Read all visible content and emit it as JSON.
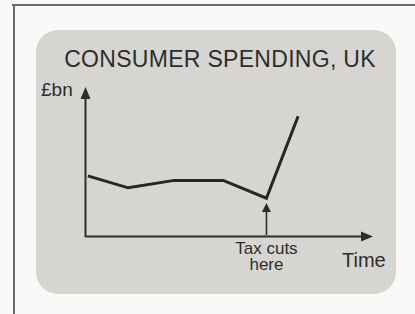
{
  "figure": {
    "title": "CONSUMER SPENDING, UK",
    "ylabel": "£bn",
    "xlabel": "Time",
    "annotation_line1": "Tax cuts",
    "annotation_line2": "here"
  },
  "chart_data": {
    "type": "line",
    "title": "CONSUMER SPENDING, UK",
    "xlabel": "Time",
    "ylabel": "£bn",
    "x_ticks": [],
    "y_ticks": [],
    "grid": false,
    "legend": false,
    "axes_note": "sketch diagram with unscaled arrow axes; coordinates normalized 0-1 along each axis",
    "xlim": [
      0,
      1
    ],
    "ylim": [
      0,
      1
    ],
    "series": [
      {
        "name": "consumer-spending",
        "points": [
          [
            0.01,
            0.41
          ],
          [
            0.15,
            0.33
          ],
          [
            0.31,
            0.38
          ],
          [
            0.48,
            0.38
          ],
          [
            0.63,
            0.26
          ],
          [
            0.74,
            0.81
          ]
        ]
      }
    ],
    "annotations": [
      {
        "text": "Tax cuts here",
        "x": 0.63,
        "style": "vertical arrow pointing up from the time axis to the low point of the line"
      }
    ]
  },
  "colors": {
    "page_bg": "#faf9f7",
    "card_bg": "#d6d5d2",
    "frame": "#6a6a6a",
    "ink": "#2d2d2d",
    "line": "#262626"
  }
}
